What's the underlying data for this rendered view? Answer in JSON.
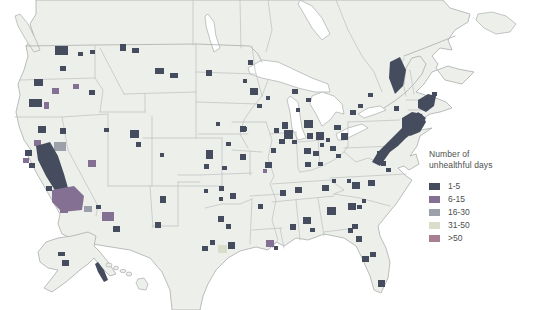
{
  "title": {
    "line1": "Number of",
    "line2": "unhealthful days"
  },
  "legend": {
    "items": [
      {
        "label": "1-5",
        "color": "#454c5e"
      },
      {
        "label": "6-15",
        "color": "#837093"
      },
      {
        "label": "16-30",
        "color": "#9ba0ab"
      },
      {
        "label": "31-50",
        "color": "#d9decb"
      },
      {
        "label": ">50",
        "color": "#a87e93"
      }
    ]
  },
  "map": {
    "land_color": "#edefeb",
    "coast_color": "#a9adab",
    "state_border_color": "#bcc0be",
    "counties": [
      [
        55,
        46,
        13,
        9,
        0
      ],
      [
        78,
        52,
        5,
        4,
        0
      ],
      [
        60,
        66,
        6,
        5,
        0
      ],
      [
        90,
        50,
        5,
        4,
        0
      ],
      [
        34,
        79,
        9,
        7,
        0
      ],
      [
        52,
        88,
        7,
        6,
        1
      ],
      [
        29,
        99,
        13,
        8,
        0
      ],
      [
        44,
        102,
        5,
        7,
        1
      ],
      [
        73,
        84,
        6,
        5,
        1
      ],
      [
        89,
        90,
        6,
        5,
        0
      ],
      [
        60,
        128,
        6,
        6,
        0
      ],
      [
        88,
        160,
        8,
        7,
        1
      ],
      [
        120,
        44,
        6,
        7,
        0
      ],
      [
        132,
        48,
        7,
        5,
        0
      ],
      [
        155,
        68,
        9,
        6,
        0
      ],
      [
        170,
        73,
        8,
        5,
        0
      ],
      [
        206,
        70,
        6,
        6,
        0
      ],
      [
        130,
        130,
        9,
        8,
        0
      ],
      [
        136,
        142,
        5,
        5,
        0
      ],
      [
        160,
        153,
        4,
        4,
        0
      ],
      [
        104,
        128,
        5,
        4,
        0
      ],
      [
        206,
        150,
        7,
        9,
        0
      ],
      [
        204,
        164,
        5,
        5,
        0
      ],
      [
        216,
        122,
        4,
        4,
        0
      ],
      [
        226,
        142,
        5,
        4,
        0
      ],
      [
        242,
        127,
        5,
        4,
        0
      ],
      [
        102,
        212,
        12,
        9,
        1
      ],
      [
        113,
        226,
        7,
        6,
        0
      ],
      [
        96,
        205,
        5,
        4,
        0
      ],
      [
        160,
        196,
        6,
        7,
        0
      ],
      [
        155,
        222,
        6,
        6,
        0
      ],
      [
        248,
        60,
        5,
        5,
        0
      ],
      [
        250,
        88,
        8,
        7,
        0
      ],
      [
        292,
        89,
        6,
        5,
        0
      ],
      [
        243,
        79,
        4,
        4,
        0
      ],
      [
        240,
        154,
        6,
        6,
        0
      ],
      [
        240,
        126,
        6,
        6,
        0
      ],
      [
        222,
        166,
        5,
        4,
        0
      ],
      [
        219,
        186,
        5,
        5,
        0
      ],
      [
        230,
        193,
        6,
        6,
        0
      ],
      [
        219,
        197,
        4,
        4,
        0
      ],
      [
        204,
        189,
        4,
        4,
        0
      ],
      [
        282,
        122,
        6,
        7,
        0
      ],
      [
        274,
        128,
        5,
        5,
        0
      ],
      [
        257,
        104,
        5,
        4,
        0
      ],
      [
        266,
        96,
        4,
        4,
        0
      ],
      [
        304,
        120,
        9,
        8,
        0
      ],
      [
        316,
        132,
        8,
        8,
        0
      ],
      [
        296,
        108,
        4,
        4,
        0
      ],
      [
        306,
        98,
        5,
        4,
        0
      ],
      [
        284,
        130,
        9,
        9,
        0
      ],
      [
        279,
        139,
        6,
        5,
        0
      ],
      [
        292,
        140,
        5,
        4,
        0
      ],
      [
        271,
        148,
        5,
        5,
        0
      ],
      [
        265,
        162,
        7,
        6,
        0
      ],
      [
        263,
        169,
        4,
        4,
        1
      ],
      [
        280,
        190,
        6,
        6,
        0
      ],
      [
        258,
        204,
        5,
        5,
        0
      ],
      [
        307,
        133,
        6,
        6,
        0
      ],
      [
        304,
        148,
        7,
        6,
        0
      ],
      [
        313,
        151,
        6,
        5,
        0
      ],
      [
        330,
        146,
        6,
        5,
        0
      ],
      [
        334,
        125,
        7,
        5,
        0
      ],
      [
        341,
        133,
        7,
        7,
        0
      ],
      [
        326,
        138,
        4,
        4,
        0
      ],
      [
        320,
        143,
        4,
        4,
        0
      ],
      [
        305,
        162,
        6,
        5,
        0
      ],
      [
        318,
        162,
        5,
        4,
        0
      ],
      [
        336,
        154,
        5,
        4,
        0
      ],
      [
        295,
        187,
        7,
        6,
        0
      ],
      [
        322,
        185,
        7,
        6,
        0
      ],
      [
        332,
        179,
        4,
        4,
        0
      ],
      [
        352,
        182,
        8,
        7,
        0
      ],
      [
        347,
        179,
        4,
        4,
        0
      ],
      [
        368,
        180,
        7,
        6,
        0
      ],
      [
        348,
        203,
        8,
        7,
        0
      ],
      [
        362,
        199,
        4,
        4,
        0
      ],
      [
        327,
        207,
        9,
        8,
        0
      ],
      [
        357,
        205,
        5,
        4,
        0
      ],
      [
        352,
        224,
        6,
        5,
        0
      ],
      [
        303,
        217,
        8,
        7,
        0
      ],
      [
        290,
        224,
        6,
        6,
        0
      ],
      [
        310,
        228,
        5,
        4,
        0
      ],
      [
        348,
        228,
        5,
        5,
        0
      ],
      [
        356,
        236,
        6,
        6,
        0
      ],
      [
        362,
        256,
        7,
        6,
        0
      ],
      [
        370,
        252,
        6,
        5,
        0
      ],
      [
        378,
        280,
        7,
        7,
        0
      ],
      [
        218,
        216,
        6,
        6,
        0
      ],
      [
        226,
        224,
        5,
        5,
        0
      ],
      [
        210,
        240,
        5,
        5,
        0
      ],
      [
        202,
        246,
        6,
        5,
        0
      ],
      [
        218,
        245,
        9,
        8,
        3
      ],
      [
        228,
        242,
        7,
        7,
        0
      ],
      [
        266,
        240,
        8,
        7,
        1
      ],
      [
        274,
        246,
        4,
        4,
        0
      ],
      [
        381,
        161,
        5,
        5,
        0
      ],
      [
        386,
        168,
        5,
        4,
        0
      ],
      [
        377,
        151,
        8,
        8,
        0
      ],
      [
        375,
        158,
        4,
        4,
        1
      ],
      [
        402,
        128,
        4,
        4,
        1
      ],
      [
        396,
        138,
        4,
        4,
        1
      ],
      [
        432,
        92,
        5,
        4,
        0
      ],
      [
        394,
        106,
        5,
        5,
        0
      ],
      [
        350,
        110,
        6,
        5,
        0
      ],
      [
        358,
        104,
        5,
        4,
        0
      ],
      [
        368,
        93,
        5,
        4,
        0
      ],
      [
        38,
        126,
        8,
        7,
        0
      ],
      [
        34,
        140,
        7,
        6,
        1
      ],
      [
        54,
        142,
        12,
        9,
        2
      ],
      [
        25,
        150,
        7,
        6,
        0
      ],
      [
        23,
        158,
        6,
        5,
        1
      ],
      [
        29,
        163,
        6,
        5,
        0
      ],
      [
        52,
        168,
        10,
        10,
        1
      ],
      [
        62,
        198,
        10,
        8,
        4
      ],
      [
        60,
        208,
        8,
        5,
        1
      ],
      [
        84,
        206,
        8,
        6,
        2
      ],
      [
        46,
        186,
        6,
        5,
        0
      ],
      [
        58,
        252,
        7,
        4,
        0
      ],
      [
        62,
        260,
        7,
        6,
        0
      ]
    ],
    "county_shapes": [
      {
        "points": "36,146 50,142 58,156 64,174 68,188 56,192 46,176 38,160",
        "cat": 0
      },
      {
        "points": "52,190 74,186 84,196 82,210 62,212 52,202",
        "cat": 1
      },
      {
        "points": "372,162 380,166 390,152 398,146 406,138 414,132 422,124 426,118 418,112 408,122 398,132 388,142 378,152",
        "cat": 0
      },
      {
        "points": "402,118 412,112 422,114 426,122 420,132 410,136 402,128",
        "cat": 0
      },
      {
        "points": "418,100 428,94 436,96 434,106 426,112 418,108",
        "cat": 0
      },
      {
        "points": "390,62 400,57 406,70 403,86 395,94 389,78",
        "cat": 0
      },
      {
        "points": "98,262 104,270 108,280 104,282 98,272 95,264",
        "cat": 0
      }
    ]
  }
}
